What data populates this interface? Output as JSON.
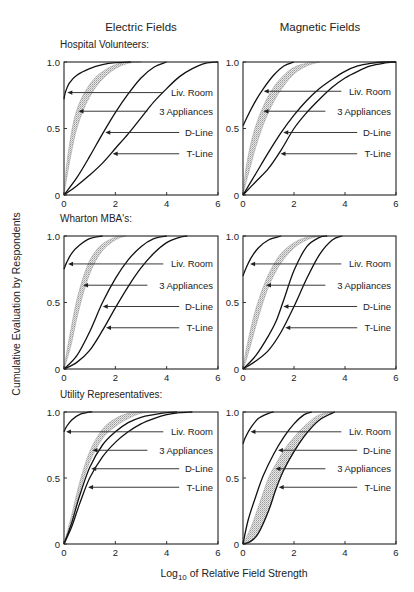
{
  "chart_data": {
    "type": "line",
    "column_titles": [
      "Electric Fields",
      "Magnetic Fields"
    ],
    "ylabel": "Cumulative Evaluation by Respondents",
    "xlabel_prefix": "Log",
    "xlabel_subscript": "10",
    "xlabel_suffix": " of Relative Field Strength",
    "xlim": [
      0,
      6
    ],
    "ylim": [
      0,
      1
    ],
    "xticks": [
      "0",
      "2",
      "4",
      "6"
    ],
    "yticks": [
      "0",
      "0.5",
      "1.0"
    ],
    "grid": false,
    "panels": [
      {
        "group": "Hospital Volunteers:",
        "field": "Electric Fields",
        "series": [
          {
            "name": "Liv. Room",
            "type": "line",
            "x": [
              0,
              0.05,
              0.2,
              0.5,
              1.0,
              1.5,
              2.0,
              2.6
            ],
            "y": [
              0.72,
              0.77,
              0.84,
              0.9,
              0.95,
              0.98,
              0.995,
              1.0
            ]
          },
          {
            "name": "3 Appliances",
            "type": "band",
            "x": [
              0,
              0.1,
              0.3,
              0.5,
              0.8,
              1.2,
              1.6,
              2.0,
              2.5,
              3.0
            ],
            "lower": [
              0,
              0.12,
              0.33,
              0.5,
              0.66,
              0.8,
              0.89,
              0.95,
              0.99,
              1.0
            ],
            "upper": [
              0,
              0.22,
              0.48,
              0.64,
              0.77,
              0.88,
              0.94,
              0.98,
              1.0,
              1.0
            ]
          },
          {
            "name": "D-Line",
            "type": "line",
            "x": [
              0,
              0.5,
              1.0,
              1.5,
              2.0,
              2.5,
              3.0,
              3.5,
              4.0
            ],
            "y": [
              0,
              0.13,
              0.29,
              0.46,
              0.62,
              0.76,
              0.88,
              0.96,
              1.0
            ]
          },
          {
            "name": "T-Line",
            "type": "line",
            "x": [
              0,
              0.5,
              1.0,
              1.5,
              2.0,
              2.5,
              3.0,
              3.5,
              4.0,
              4.5,
              5.0,
              5.5,
              6.0
            ],
            "y": [
              0,
              0.07,
              0.15,
              0.24,
              0.35,
              0.46,
              0.58,
              0.7,
              0.8,
              0.89,
              0.95,
              0.99,
              1.0
            ]
          }
        ],
        "labels": [
          {
            "text": "Liv. Room",
            "series": "Liv. Room",
            "y": 0.77
          },
          {
            "text": "3 Appliances",
            "series": "3 Appliances",
            "y": 0.63
          },
          {
            "text": "D-Line",
            "series": "D-Line",
            "y": 0.47
          },
          {
            "text": "T-Line",
            "series": "T-Line",
            "y": 0.31
          }
        ]
      },
      {
        "group": "",
        "field": "Magnetic Fields",
        "series": [
          {
            "name": "Liv. Room",
            "type": "line",
            "x": [
              0,
              0.25,
              0.5,
              0.8,
              1.2,
              1.6,
              2.0
            ],
            "y": [
              0.52,
              0.62,
              0.71,
              0.8,
              0.9,
              0.97,
              1.0
            ]
          },
          {
            "name": "3 Appliances",
            "type": "band",
            "x": [
              0,
              0.1,
              0.3,
              0.5,
              0.8,
              1.2,
              1.6,
              2.0,
              2.5,
              3.0
            ],
            "lower": [
              0,
              0.08,
              0.22,
              0.36,
              0.53,
              0.7,
              0.82,
              0.91,
              0.97,
              1.0
            ],
            "upper": [
              0,
              0.18,
              0.38,
              0.52,
              0.67,
              0.81,
              0.9,
              0.96,
              0.99,
              1.0
            ]
          },
          {
            "name": "D-Line",
            "type": "line",
            "x": [
              0,
              0.5,
              1.0,
              1.5,
              2.0,
              2.5,
              3.0,
              3.5,
              4.0,
              4.5,
              5.0,
              5.5,
              6.0
            ],
            "y": [
              0,
              0.16,
              0.32,
              0.47,
              0.6,
              0.71,
              0.8,
              0.87,
              0.93,
              0.97,
              0.99,
              1.0,
              1.0
            ]
          },
          {
            "name": "T-Line",
            "type": "line",
            "x": [
              0,
              0.5,
              1.0,
              1.5,
              2.0,
              2.5,
              3.0,
              3.5,
              4.0,
              4.5,
              5.0,
              5.5,
              6.0
            ],
            "y": [
              0,
              0.1,
              0.2,
              0.34,
              0.5,
              0.62,
              0.72,
              0.81,
              0.88,
              0.93,
              0.97,
              0.99,
              1.0
            ]
          }
        ],
        "labels": [
          {
            "text": "Liv. Room",
            "series": "Liv. Room",
            "y": 0.78
          },
          {
            "text": "3 Appliances",
            "series": "3 Appliances",
            "y": 0.63
          },
          {
            "text": "D-Line",
            "series": "D-Line",
            "y": 0.47
          },
          {
            "text": "T-Line",
            "series": "T-Line",
            "y": 0.31
          }
        ]
      },
      {
        "group": "Wharton MBA's:",
        "field": "Electric Fields",
        "series": [
          {
            "name": "Liv. Room",
            "type": "line",
            "x": [
              0,
              0.1,
              0.3,
              0.6,
              1.0,
              1.5
            ],
            "y": [
              0.75,
              0.8,
              0.87,
              0.93,
              0.98,
              1.0
            ]
          },
          {
            "name": "3 Appliances",
            "type": "band",
            "x": [
              0,
              0.1,
              0.3,
              0.5,
              0.8,
              1.1,
              1.5,
              2.0,
              2.4
            ],
            "lower": [
              0,
              0.06,
              0.2,
              0.38,
              0.6,
              0.76,
              0.89,
              0.97,
              1.0
            ],
            "upper": [
              0,
              0.12,
              0.33,
              0.52,
              0.72,
              0.85,
              0.94,
              0.99,
              1.0
            ]
          },
          {
            "name": "D-Line",
            "type": "line",
            "x": [
              0,
              0.5,
              1.0,
              1.5,
              2.0,
              2.5,
              3.0,
              3.5,
              4.0
            ],
            "y": [
              0,
              0.1,
              0.28,
              0.5,
              0.68,
              0.82,
              0.92,
              0.98,
              1.0
            ]
          },
          {
            "name": "T-Line",
            "type": "line",
            "x": [
              0,
              0.5,
              1.0,
              1.5,
              2.0,
              2.5,
              3.0,
              3.5,
              4.0,
              4.5,
              4.8
            ],
            "y": [
              0,
              0.05,
              0.14,
              0.29,
              0.46,
              0.62,
              0.76,
              0.87,
              0.95,
              0.99,
              1.0
            ]
          }
        ],
        "labels": [
          {
            "text": "Liv. Room",
            "series": "Liv. Room",
            "y": 0.79
          },
          {
            "text": "3 Appliances",
            "series": "3 Appliances",
            "y": 0.63
          },
          {
            "text": "D-Line",
            "series": "D-Line",
            "y": 0.47
          },
          {
            "text": "T-Line",
            "series": "T-Line",
            "y": 0.31
          }
        ]
      },
      {
        "group": "",
        "field": "Magnetic Fields",
        "series": [
          {
            "name": "Liv. Room",
            "type": "line",
            "x": [
              0,
              0.1,
              0.3,
              0.6,
              1.0,
              1.5
            ],
            "y": [
              0.7,
              0.75,
              0.83,
              0.91,
              0.97,
              1.0
            ]
          },
          {
            "name": "3 Appliances",
            "type": "band",
            "x": [
              0,
              0.1,
              0.3,
              0.5,
              0.8,
              1.1,
              1.5,
              2.0,
              2.5,
              3.0
            ],
            "lower": [
              0,
              0.05,
              0.18,
              0.32,
              0.51,
              0.66,
              0.8,
              0.91,
              0.97,
              1.0
            ],
            "upper": [
              0,
              0.12,
              0.3,
              0.45,
              0.62,
              0.75,
              0.87,
              0.95,
              0.99,
              1.0
            ]
          },
          {
            "name": "D-Line",
            "type": "line",
            "x": [
              0,
              0.5,
              1.0,
              1.3,
              1.6,
              2.0,
              2.5,
              3.0,
              3.3
            ],
            "y": [
              0,
              0.1,
              0.25,
              0.36,
              0.52,
              0.74,
              0.92,
              0.99,
              1.0
            ]
          },
          {
            "name": "T-Line",
            "type": "line",
            "x": [
              0,
              0.5,
              1.0,
              1.5,
              2.0,
              2.5,
              3.0,
              3.5,
              3.9
            ],
            "y": [
              0,
              0.06,
              0.14,
              0.28,
              0.47,
              0.68,
              0.86,
              0.97,
              1.0
            ]
          }
        ],
        "labels": [
          {
            "text": "Liv. Room",
            "series": "Liv. Room",
            "y": 0.79
          },
          {
            "text": "3 Appliances",
            "series": "3 Appliances",
            "y": 0.63
          },
          {
            "text": "D-Line",
            "series": "D-Line",
            "y": 0.47
          },
          {
            "text": "T-Line",
            "series": "T-Line",
            "y": 0.31
          }
        ]
      },
      {
        "group": "Utility Representatives:",
        "field": "Electric Fields",
        "series": [
          {
            "name": "Liv. Room",
            "type": "line",
            "x": [
              0,
              0.1,
              0.3,
              0.6,
              1.0,
              1.1
            ],
            "y": [
              0.85,
              0.89,
              0.94,
              0.98,
              1.0,
              1.0
            ]
          },
          {
            "name": "3 Appliances",
            "type": "band",
            "x": [
              0,
              0.3,
              0.6,
              1.0,
              1.5,
              2.0,
              2.5,
              3.0,
              3.6
            ],
            "lower": [
              0,
              0.17,
              0.39,
              0.62,
              0.8,
              0.89,
              0.95,
              0.99,
              1.0
            ],
            "upper": [
              0,
              0.22,
              0.46,
              0.7,
              0.87,
              0.95,
              0.99,
              1.0,
              1.0
            ]
          },
          {
            "name": "D-Line",
            "type": "line",
            "x": [
              0,
              0.3,
              0.6,
              1.0,
              1.5,
              2.0,
              2.5,
              3.0,
              3.5,
              4.0,
              4.4
            ],
            "y": [
              0,
              0.16,
              0.36,
              0.58,
              0.75,
              0.85,
              0.92,
              0.96,
              0.98,
              0.995,
              1.0
            ]
          },
          {
            "name": "T-Line",
            "type": "line",
            "x": [
              0,
              0.3,
              0.6,
              1.0,
              1.5,
              2.0,
              2.5,
              3.0,
              3.5,
              4.0,
              4.5,
              5.0
            ],
            "y": [
              0,
              0.13,
              0.3,
              0.5,
              0.66,
              0.77,
              0.85,
              0.91,
              0.95,
              0.98,
              0.995,
              1.0
            ]
          }
        ],
        "labels": [
          {
            "text": "Liv. Room",
            "series": "Liv. Room",
            "y": 0.85
          },
          {
            "text": "3 Appliances",
            "series": "3 Appliances",
            "y": 0.71
          },
          {
            "text": "D-Line",
            "series": "D-Line",
            "y": 0.57
          },
          {
            "text": "T-Line",
            "series": "T-Line",
            "y": 0.43
          }
        ]
      },
      {
        "group": "",
        "field": "Magnetic Fields",
        "series": [
          {
            "name": "Liv. Room",
            "type": "line",
            "x": [
              0,
              0.1,
              0.3,
              0.6,
              1.0,
              1.2
            ],
            "y": [
              0.76,
              0.81,
              0.88,
              0.95,
              0.99,
              1.0
            ]
          },
          {
            "name": "3 Appliances",
            "type": "band",
            "x": [
              0,
              0.3,
              0.6,
              1.0,
              1.3,
              1.6,
              2.0,
              2.5,
              3.0,
              3.6
            ],
            "lower": [
              0,
              0.02,
              0.08,
              0.25,
              0.42,
              0.56,
              0.7,
              0.84,
              0.94,
              1.0
            ],
            "upper": [
              0,
              0.12,
              0.28,
              0.5,
              0.61,
              0.71,
              0.81,
              0.91,
              0.98,
              1.0
            ]
          },
          {
            "name": "D-Line",
            "type": "line",
            "x": [
              0,
              0.2,
              0.5,
              0.8,
              1.2,
              1.6,
              2.0,
              2.4,
              2.7
            ],
            "y": [
              0,
              0.18,
              0.36,
              0.52,
              0.68,
              0.81,
              0.91,
              0.98,
              1.0
            ]
          },
          {
            "name": "T-Line",
            "type": "line",
            "x": [
              0,
              0.3,
              0.6,
              1.0,
              1.3,
              1.6,
              2.0,
              2.5,
              3.0,
              3.6
            ],
            "y": [
              0,
              0.02,
              0.08,
              0.25,
              0.42,
              0.56,
              0.7,
              0.84,
              0.94,
              1.0
            ]
          }
        ],
        "labels": [
          {
            "text": "Liv. Room",
            "series": "Liv. Room",
            "y": 0.85
          },
          {
            "text": "D-Line",
            "series": "D-Line",
            "y": 0.71
          },
          {
            "text": "3 Appliances",
            "series": "3 Appliances",
            "y": 0.57
          },
          {
            "text": "T-Line",
            "series": "T-Line",
            "y": 0.43
          }
        ]
      }
    ]
  }
}
